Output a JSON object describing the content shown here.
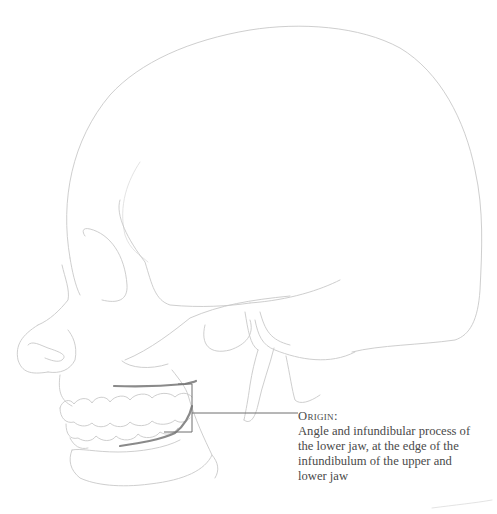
{
  "figure": {
    "highlight_color": "#8a8a8a",
    "line_color": "#c8c8c8"
  },
  "annotation": {
    "heading": "Origin:",
    "lines": [
      "Angle and infundibular process of",
      "the lower jaw, at the edge of the",
      "infundibulum of the upper and",
      "lower jaw"
    ]
  }
}
